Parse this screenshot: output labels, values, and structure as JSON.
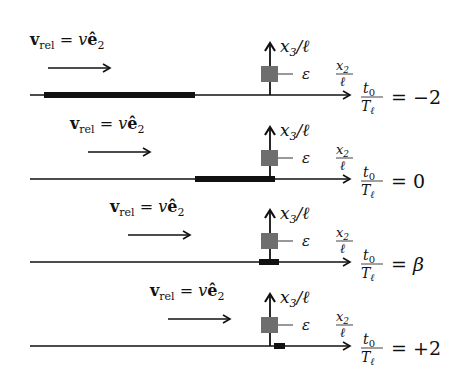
{
  "diagram": {
    "type": "time-sequence schematic",
    "colors": {
      "line": "#111111",
      "bar": "#111111",
      "obstacle": "#6e6e6e",
      "background": "#ffffff"
    },
    "labels": {
      "velocity_v": "v",
      "velocity_sub": "rel",
      "velocity_eq": " = ",
      "velocity_rhs_v": "v",
      "velocity_rhs_e": "ê",
      "velocity_rhs_sub": "2",
      "vertical_axis_num": "x",
      "vertical_axis_sub": "3",
      "vertical_axis_rest": "/ℓ",
      "obstacle_height": "ε",
      "horizontal_axis_num": "x",
      "horizontal_axis_sub": "2",
      "horizontal_axis_den": "ℓ",
      "time_num": "t",
      "time_num_sub": "0",
      "time_den": "T",
      "time_den_sub": "ℓ",
      "time_eq": "="
    },
    "panels": [
      {
        "id": "panel-1",
        "time_value": "−2",
        "baseline_y": 95,
        "bar_start_x": 44,
        "bar_end_x": 195,
        "vrel_x": 30,
        "arrow_start_x": 48,
        "arrow_end_x": 110
      },
      {
        "id": "panel-2",
        "time_value": "0",
        "baseline_y": 179,
        "bar_start_x": 195,
        "bar_end_x": 275,
        "vrel_x": 70,
        "arrow_start_x": 88,
        "arrow_end_x": 150
      },
      {
        "id": "panel-3",
        "time_value": "β",
        "baseline_y": 262,
        "bar_start_x": 259,
        "bar_end_x": 279,
        "vrel_x": 110,
        "arrow_start_x": 128,
        "arrow_end_x": 190
      },
      {
        "id": "panel-4",
        "time_value": "+2",
        "baseline_y": 346,
        "bar_start_x": 274,
        "bar_end_x": 285,
        "vrel_x": 150,
        "arrow_start_x": 168,
        "arrow_end_x": 230
      }
    ]
  }
}
